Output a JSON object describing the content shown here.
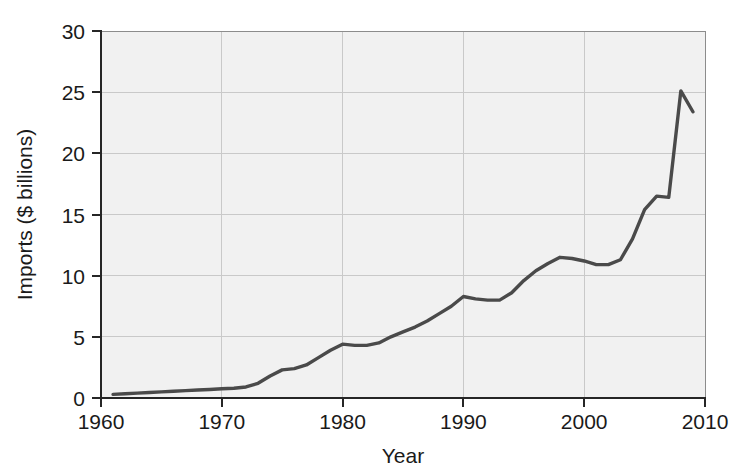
{
  "chart_data": {
    "type": "line",
    "title": "",
    "subtitle": "",
    "xlabel": "Year",
    "ylabel": "Imports ($ billions)",
    "xlim": [
      1960,
      2010
    ],
    "ylim": [
      0,
      30
    ],
    "xticks": [
      "1960",
      "1970",
      "1980",
      "1990",
      "2000",
      "2010"
    ],
    "xtick_values": [
      1960,
      1970,
      1980,
      1990,
      2000,
      2010
    ],
    "yticks": [
      "0",
      "5",
      "10",
      "15",
      "20",
      "25",
      "30"
    ],
    "ytick_values": [
      0,
      5,
      10,
      15,
      20,
      25,
      30
    ],
    "grid": true,
    "grid_axis": "both",
    "legend": false,
    "legend_position": "none",
    "line_color": "#4a4a4a",
    "plot_background": "#f1f1f1",
    "grid_color": "#c9c9c9",
    "axis_color": "#262626",
    "series": [
      {
        "name": "Imports",
        "x": [
          1961,
          1962,
          1963,
          1964,
          1965,
          1966,
          1967,
          1968,
          1969,
          1970,
          1971,
          1972,
          1973,
          1974,
          1975,
          1976,
          1977,
          1978,
          1979,
          1980,
          1981,
          1982,
          1983,
          1984,
          1985,
          1986,
          1987,
          1988,
          1989,
          1990,
          1991,
          1992,
          1993,
          1994,
          1995,
          1996,
          1997,
          1998,
          1999,
          2000,
          2001,
          2002,
          2003,
          2004,
          2005,
          2006,
          2007,
          2008,
          2009
        ],
        "values": [
          0.3,
          0.35,
          0.4,
          0.45,
          0.5,
          0.55,
          0.6,
          0.65,
          0.7,
          0.75,
          0.8,
          0.9,
          1.2,
          1.8,
          2.3,
          2.4,
          2.7,
          3.3,
          3.9,
          4.4,
          4.3,
          4.3,
          4.5,
          5.0,
          5.4,
          5.8,
          6.3,
          6.9,
          7.5,
          8.3,
          8.1,
          8.0,
          8.0,
          8.6,
          9.6,
          10.4,
          11.0,
          11.5,
          11.4,
          11.2,
          10.9,
          10.9,
          11.3,
          13.0,
          15.4,
          16.5,
          16.4,
          25.1,
          23.4
        ]
      }
    ]
  },
  "axis": {
    "y_label": "Imports ($ billions)",
    "x_label": "Year",
    "y_tick_0": "0",
    "y_tick_1": "5",
    "y_tick_2": "10",
    "y_tick_3": "15",
    "y_tick_4": "20",
    "y_tick_5": "25",
    "y_tick_6": "30",
    "x_tick_0": "1960",
    "x_tick_1": "1970",
    "x_tick_2": "1980",
    "x_tick_3": "1990",
    "x_tick_4": "2000",
    "x_tick_5": "2010"
  }
}
